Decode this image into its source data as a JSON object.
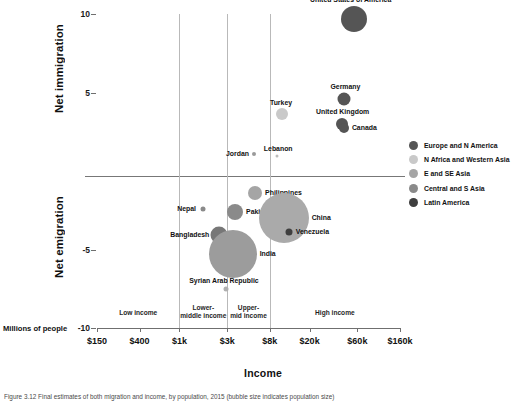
{
  "axes": {
    "ylabel_top": "Net immigration",
    "ylabel_bottom": "Net emigration",
    "yunit_note": "Millions of people",
    "xlabel": "Income"
  },
  "caption": {
    "text": "Figure 3.12  Final estimates of both migration and income, by population, 2015 (bubble size indicates population size)"
  },
  "legend": {
    "items": [
      {
        "label": "Europe and N America",
        "color": "#555555"
      },
      {
        "label": "N Africa and Western Asia",
        "color": "#c9c9c9"
      },
      {
        "label": "E and SE Asia",
        "color": "#a5a5a5"
      },
      {
        "label": "Central and S Asia",
        "color": "#8a8a8a"
      },
      {
        "label": "Latin America",
        "color": "#3f3f3f"
      }
    ]
  },
  "chart_data": {
    "type": "scatter",
    "title": "",
    "xlabel": "Income",
    "ylabel": "Millions of people",
    "xscale": "log",
    "xlim": [
      150,
      160000
    ],
    "ylim": [
      -10,
      10
    ],
    "grid": "vertical gridlines at income band boundaries $1k, $3k, $8k",
    "legend_position": "right",
    "xticks": [
      "$150",
      "$400",
      "$1k",
      "$3k",
      "$8k",
      "$20k",
      "$60k",
      "$160k"
    ],
    "xtick_values": [
      150,
      400,
      1000,
      3000,
      8000,
      20000,
      60000,
      160000
    ],
    "yticks": [
      "10",
      "5",
      "-5",
      "-10"
    ],
    "ytick_values": [
      10,
      5,
      -5,
      -10
    ],
    "income_bands": [
      {
        "label": "Low income",
        "xmin": 150,
        "xmax": 1000
      },
      {
        "label": "Lower-\nmiddle income",
        "xmin": 1000,
        "xmax": 3000
      },
      {
        "label": "Upper-\nmid income",
        "xmin": 3000,
        "xmax": 8000
      },
      {
        "label": "High income",
        "xmin": 8000,
        "xmax": 160000
      }
    ],
    "points": [
      {
        "name": "United States of America",
        "income": 55000,
        "net_migration": 9.7,
        "size": 26,
        "group": "Europe and N America",
        "color": "#555555",
        "label_pos": "top"
      },
      {
        "name": "Germany",
        "income": 44000,
        "net_migration": 4.6,
        "size": 13,
        "group": "Europe and N America",
        "color": "#555555",
        "label_pos": "top"
      },
      {
        "name": "Turkey",
        "income": 10500,
        "net_migration": 3.6,
        "size": 12,
        "group": "N Africa and Western Asia",
        "color": "#c9c9c9",
        "label_pos": "top"
      },
      {
        "name": "United Kingdom",
        "income": 42000,
        "net_migration": 3.0,
        "size": 12,
        "group": "Europe and N America",
        "color": "#555555",
        "label_pos": "top"
      },
      {
        "name": "Canada",
        "income": 44000,
        "net_migration": 2.75,
        "size": 10,
        "group": "Europe and N America",
        "color": "#555555",
        "label_pos": "right"
      },
      {
        "name": "Jordan",
        "income": 5600,
        "net_migration": 1.1,
        "size": 4,
        "group": "N Africa and Western Asia",
        "color": "#9a9a9a",
        "label_pos": "left"
      },
      {
        "name": "Lebanon",
        "income": 9500,
        "net_migration": 0.95,
        "size": 3,
        "group": "N Africa and Western Asia",
        "color": "#bbbbbb",
        "label_pos": "top"
      },
      {
        "name": "Philippines",
        "income": 5700,
        "net_migration": -1.4,
        "size": 14,
        "group": "E and SE Asia",
        "color": "#a5a5a5",
        "label_pos": "right"
      },
      {
        "name": "Nepal",
        "income": 1700,
        "net_migration": -2.4,
        "size": 5,
        "group": "Central and S Asia",
        "color": "#8a8a8a",
        "label_pos": "left"
      },
      {
        "name": "Pakistan",
        "income": 3600,
        "net_migration": -2.6,
        "size": 16,
        "group": "Central and S Asia",
        "color": "#8a8a8a",
        "label_pos": "right"
      },
      {
        "name": "China",
        "income": 11000,
        "net_migration": -3.0,
        "size": 50,
        "group": "E and SE Asia",
        "color": "#aaaaaa",
        "label_pos": "right"
      },
      {
        "name": "Venezuela",
        "income": 12500,
        "net_migration": -3.9,
        "size": 7,
        "group": "Latin America",
        "color": "#3f3f3f",
        "label_pos": "right"
      },
      {
        "name": "Bangladesh",
        "income": 2500,
        "net_migration": -4.1,
        "size": 17,
        "group": "Central and S Asia",
        "color": "#777777",
        "label_pos": "left"
      },
      {
        "name": "India",
        "income": 3400,
        "net_migration": -5.3,
        "size": 48,
        "group": "Central and S Asia",
        "color": "#9c9c9c",
        "label_pos": "right"
      },
      {
        "name": "Syrian Arab Republic",
        "income": 2900,
        "net_migration": -7.5,
        "size": 5,
        "group": "N Africa and Western Asia",
        "color": "#b0b0b0",
        "label_pos": "top"
      }
    ]
  }
}
